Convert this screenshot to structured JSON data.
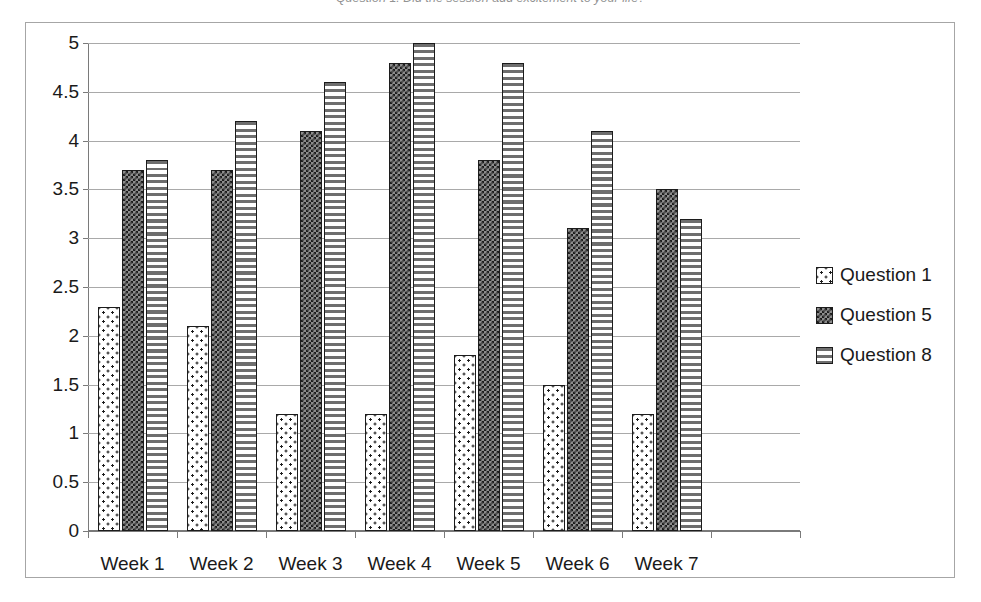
{
  "caption": {
    "text": "Question 1: Did the session add excitement to your life?"
  },
  "chart_data": {
    "type": "bar",
    "title": "",
    "xlabel": "",
    "ylabel": "",
    "categories": [
      "Week 1",
      "Week 2",
      "Week 3",
      "Week  4",
      "Week 5",
      "Week 6",
      "Week 7"
    ],
    "series": [
      {
        "name": "Question 1",
        "pattern": "dotted-light",
        "values": [
          2.3,
          2.1,
          1.2,
          1.2,
          1.8,
          1.5,
          1.2
        ]
      },
      {
        "name": "Question 5",
        "pattern": "checkered-dark",
        "values": [
          3.7,
          3.7,
          4.1,
          4.8,
          3.8,
          3.1,
          3.5
        ]
      },
      {
        "name": "Question 8",
        "pattern": "horizontal-stripes",
        "values": [
          3.8,
          4.2,
          4.6,
          5.0,
          4.8,
          4.1,
          3.2
        ]
      }
    ],
    "ylim": [
      0,
      5
    ],
    "ytick_step": 0.5,
    "ytick_labels": [
      "0",
      "0.5",
      "1",
      "1.5",
      "2",
      "2.5",
      "3",
      "3.5",
      "4",
      "4.5",
      "5"
    ],
    "grid": true,
    "legend_position": "right",
    "colors": {
      "bar_outline": "#1c1c1c",
      "gridline": "#a9a9a9",
      "axis": "#7a7a7a",
      "frame": "#a6a6a6",
      "background": "#ffffff",
      "text": "#1a1a1a"
    }
  }
}
